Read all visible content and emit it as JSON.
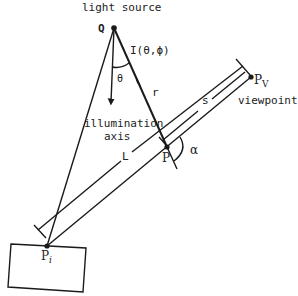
{
  "diagram": {
    "labels": {
      "light_source": "light source",
      "Q": "Q",
      "intensity": "I(θ,ϕ)",
      "theta": "θ",
      "r": "r",
      "illumination": "illumination",
      "axis": "axis",
      "L": "L",
      "s": "s",
      "P": "P",
      "alpha": "α",
      "Pv_main": "P",
      "Pv_sub": "V",
      "viewpoint": "viewpoint",
      "Pi_main": "P",
      "Pi_sub": "i"
    },
    "colors": {
      "ink": "#1a1a1a",
      "background": "#ffffff"
    }
  }
}
